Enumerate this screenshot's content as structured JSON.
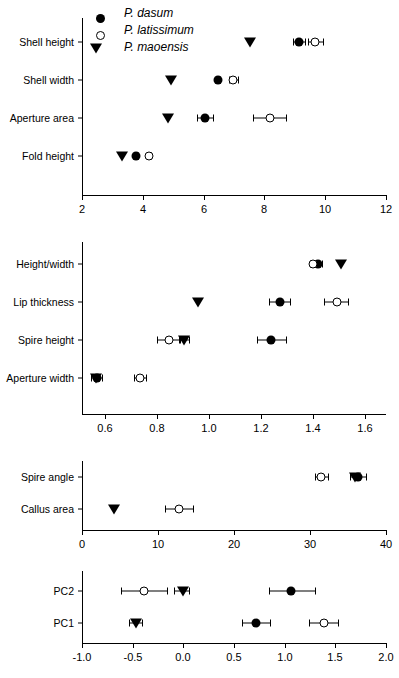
{
  "figure": {
    "legend": {
      "items": [
        {
          "label": "P. dasum",
          "marker": "filled-circle"
        },
        {
          "label": "P. latissimum",
          "marker": "open-circle"
        },
        {
          "label": "P. maoensis",
          "marker": "filled-triangle"
        }
      ]
    }
  },
  "chart_data": [
    {
      "type": "scatter",
      "panel": "panel-1",
      "title": "",
      "xlabel": "",
      "ylabel": "",
      "xlim": [
        2,
        12
      ],
      "xticks": [
        2,
        4,
        6,
        8,
        10,
        12
      ],
      "xticklabels": [
        "2",
        "4",
        "6",
        "8",
        "10",
        "12"
      ],
      "categories": [
        "Shell height",
        "Shell width",
        "Aperture area",
        "Fold height"
      ],
      "grid": false,
      "legend_position": "top-left",
      "series": [
        {
          "name": "P. dasum",
          "marker": "filled-circle",
          "values": [
            9.15,
            6.48,
            6.03,
            3.78
          ],
          "err_low": [
            8.95,
            6.42,
            5.78,
            3.72
          ],
          "err_high": [
            9.35,
            6.54,
            6.3,
            3.84
          ]
        },
        {
          "name": "P. latissimum",
          "marker": "open-circle",
          "values": [
            9.68,
            6.98,
            8.18,
            4.22
          ],
          "err_low": [
            9.45,
            6.82,
            7.62,
            4.16
          ],
          "err_high": [
            9.92,
            7.13,
            8.72,
            4.28
          ]
        },
        {
          "name": "P. maoensis",
          "marker": "filled-triangle",
          "values": [
            7.52,
            4.93,
            4.83,
            3.32
          ],
          "err_low": [
            7.52,
            4.93,
            4.83,
            3.32
          ],
          "err_high": [
            7.52,
            4.93,
            4.83,
            3.32
          ]
        }
      ]
    },
    {
      "type": "scatter",
      "panel": "panel-2",
      "title": "",
      "xlabel": "",
      "ylabel": "",
      "xlim": [
        0.51,
        1.68
      ],
      "xticks": [
        0.6,
        0.8,
        1.0,
        1.2,
        1.4,
        1.6
      ],
      "xticklabels": [
        "0.6",
        "0.8",
        "1.0",
        "1.2",
        "1.4",
        "1.6"
      ],
      "categories": [
        "Height/width",
        "Lip thickness",
        "Spire height",
        "Aperture width"
      ],
      "grid": false,
      "series": [
        {
          "name": "P. dasum",
          "marker": "filled-circle",
          "values": [
            1.418,
            1.272,
            1.238,
            0.566
          ],
          "err_low": [
            1.4,
            1.228,
            1.182,
            0.545
          ],
          "err_high": [
            1.432,
            1.312,
            1.296,
            0.588
          ]
        },
        {
          "name": "P. latissimum",
          "marker": "open-circle",
          "values": [
            1.398,
            1.49,
            0.845,
            0.733
          ],
          "err_low": [
            1.386,
            1.442,
            0.8,
            0.712
          ],
          "err_high": [
            1.408,
            1.535,
            0.888,
            0.755
          ]
        },
        {
          "name": "P. maoensis",
          "marker": "filled-triangle",
          "values": [
            1.508,
            0.955,
            0.902,
            0.562
          ],
          "err_low": [
            1.508,
            0.955,
            0.882,
            0.562
          ],
          "err_high": [
            1.508,
            0.955,
            0.922,
            0.562
          ]
        }
      ]
    },
    {
      "type": "scatter",
      "panel": "panel-3",
      "title": "",
      "xlabel": "",
      "ylabel": "",
      "xlim": [
        0,
        40
      ],
      "xticks": [
        0,
        10,
        20,
        30,
        40
      ],
      "xticklabels": [
        "0",
        "10",
        "20",
        "30",
        "40"
      ],
      "categories": [
        "Spire angle",
        "Callus area"
      ],
      "grid": false,
      "series": [
        {
          "name": "P. dasum",
          "marker": "filled-circle",
          "values": [
            36.3,
            null
          ],
          "err_low": [
            35.2,
            null
          ],
          "err_high": [
            37.4,
            null
          ]
        },
        {
          "name": "P. latissimum",
          "marker": "open-circle",
          "values": [
            31.5,
            12.8
          ],
          "err_low": [
            30.6,
            10.9
          ],
          "err_high": [
            32.4,
            14.6
          ]
        },
        {
          "name": "P. maoensis",
          "marker": "filled-triangle",
          "values": [
            35.9,
            4.2
          ],
          "err_low": [
            35.9,
            4.2
          ],
          "err_high": [
            35.9,
            4.2
          ]
        }
      ]
    },
    {
      "type": "scatter",
      "panel": "panel-4",
      "title": "",
      "xlabel": "",
      "ylabel": "",
      "xlim": [
        -1.0,
        2.0
      ],
      "xticks": [
        -1.0,
        -0.5,
        0.0,
        0.5,
        1.0,
        1.5,
        2.0
      ],
      "xticklabels": [
        "-1.0",
        "-0.5",
        "0.0",
        "0.5",
        "1.0",
        "1.5",
        "2.0"
      ],
      "categories": [
        "PC2",
        "PC1"
      ],
      "grid": false,
      "series": [
        {
          "name": "P. dasum",
          "marker": "filled-circle",
          "values": [
            1.06,
            0.72
          ],
          "err_low": [
            0.85,
            0.575
          ],
          "err_high": [
            1.3,
            0.86
          ]
        },
        {
          "name": "P. latissimum",
          "marker": "open-circle",
          "values": [
            -0.39,
            1.39
          ],
          "err_low": [
            -0.62,
            1.24
          ],
          "err_high": [
            -0.16,
            1.53
          ]
        },
        {
          "name": "P. maoensis",
          "marker": "filled-triangle",
          "values": [
            0.0,
            -0.47
          ],
          "err_low": [
            -0.09,
            -0.535
          ],
          "err_high": [
            0.06,
            -0.41
          ]
        }
      ]
    }
  ]
}
